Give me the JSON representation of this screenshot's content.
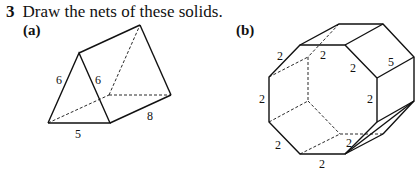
{
  "question": {
    "number": "3",
    "text": "Draw the nets of these solids."
  },
  "parts": [
    {
      "label": "(a)",
      "solid": "triangular prism",
      "dimensions": {
        "side_left": "6",
        "side_right": "6",
        "base": "5",
        "length": "8"
      }
    },
    {
      "label": "(b)",
      "solid": "octagonal prism",
      "dimensions": {
        "top_left_edge": "2",
        "top_edge": "2",
        "top_right_edge": "2",
        "depth": "5",
        "left_edge": "2",
        "right_edge": "2",
        "bottom_left_edge": "2",
        "bottom_right_edge": "2",
        "bottom_edge": "2"
      }
    }
  ]
}
